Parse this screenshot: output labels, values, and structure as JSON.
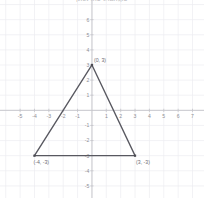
{
  "figure": {
    "title": "plot the triangle",
    "width": 204,
    "height": 198,
    "background_color": "#ffffff",
    "grid_color": "#ededf1",
    "axis_color": "#c4c4c9",
    "shape_color": "#585860",
    "label_color": "#8e8e94"
  },
  "chart_data": {
    "type": "scatter",
    "title": "plot the triangle",
    "xlabel": "",
    "ylabel": "",
    "grid": true,
    "legend": "none",
    "xlim": [
      -6.4,
      7.8
    ],
    "ylim": [
      -5.8,
      7.3
    ],
    "x_ticks": [
      -5,
      -4,
      -3,
      -2,
      -1,
      1,
      2,
      3,
      4,
      5,
      6,
      7
    ],
    "y_ticks": [
      6,
      5,
      4,
      3,
      2,
      1,
      -1,
      -2,
      -3,
      -4,
      -5
    ],
    "x_tick_labels": [
      "-5",
      "-4",
      "-3",
      "-2",
      "-1",
      "1",
      "2",
      "3",
      "4",
      "5",
      "6",
      "7"
    ],
    "y_tick_labels": [
      "6",
      "5",
      "4",
      "3",
      "2",
      "1",
      "-1",
      "-2",
      "-3",
      "-4",
      "-5"
    ],
    "shapes": [
      {
        "name": "triangle",
        "closed": true,
        "points": [
          [
            0,
            3
          ],
          [
            3,
            -3
          ],
          [
            -4,
            -3
          ]
        ]
      }
    ],
    "annotations": [
      {
        "text": "(0, 3)",
        "x": 0,
        "y": 3,
        "dx": 2,
        "dy": -3
      },
      {
        "text": "(-4, -3)",
        "x": -4,
        "y": -3,
        "dx": -1,
        "dy": 8
      },
      {
        "text": "(3, -3)",
        "x": 3,
        "y": -3,
        "dx": 1,
        "dy": 8
      }
    ]
  }
}
